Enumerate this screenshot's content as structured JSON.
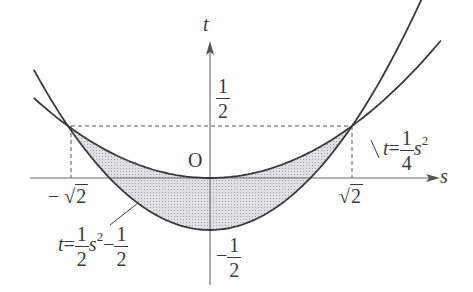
{
  "figure": {
    "type": "parabola-region-diagram",
    "axes": {
      "horizontal_label": "s",
      "vertical_label": "t",
      "origin_label": "O"
    },
    "ticks": {
      "t_half": {
        "num": "1",
        "den": "2"
      },
      "t_neg_half": {
        "sign": "−",
        "num": "1",
        "den": "2"
      },
      "s_neg_sqrt2": {
        "sign": "−",
        "radical": "√",
        "radicand": "2"
      },
      "s_pos_sqrt2": {
        "radical": "√",
        "radicand": "2"
      }
    },
    "curves": [
      {
        "name": "upper-parabola",
        "label_var": "t",
        "label_eq": "=",
        "coef_num": "1",
        "coef_den": "4",
        "var": "s",
        "exp": "2"
      },
      {
        "name": "lower-parabola",
        "label_var": "t",
        "label_eq": "=",
        "coef_num": "1",
        "coef_den": "2",
        "var": "s",
        "exp": "2",
        "const_sign": "−",
        "const_num": "1",
        "const_den": "2"
      }
    ],
    "intersections": [
      {
        "s": "-√2",
        "t": "1/2"
      },
      {
        "s": "√2",
        "t": "1/2"
      }
    ],
    "colors": {
      "line": "#3a3a3a",
      "axis": "#6a6a6a",
      "fill": "#cfd3d3",
      "dash": "#555555"
    }
  }
}
